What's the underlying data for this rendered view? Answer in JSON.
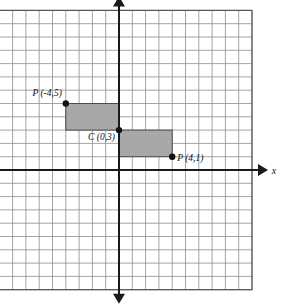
{
  "figure": {
    "background_color": "#ffffff",
    "grid_line_color": "#9a9a9a",
    "grid_border_color": "#555555",
    "axis_color": "#1a1a1a",
    "shape_fill_color": "#a8a8a8",
    "shape_stroke_color": "#4a4a4a",
    "point_color": "#111111"
  },
  "axes": {
    "x_label": "x",
    "y_label": "y",
    "origin_px": {
      "x": 119,
      "y": 170
    },
    "cell_size_px": 13.3,
    "x_range": [
      -9,
      10
    ],
    "y_range": [
      -9,
      12
    ],
    "grid_columns": 19,
    "grid_rows": 21,
    "show_tick_numbers": false
  },
  "chart_data": {
    "type": "scatter",
    "xlabel": "x",
    "ylabel": "y",
    "xlim": [
      -9,
      10
    ],
    "ylim": [
      -9,
      12
    ],
    "grid": true,
    "legend": "none",
    "points": [
      {
        "id": "p1",
        "label": "P (-4,5)",
        "x": -4,
        "y": 5,
        "label_dx": -4,
        "label_dy": -8,
        "label_anchor": "end"
      },
      {
        "id": "c",
        "label": "C (0,3)",
        "x": 0,
        "y": 3,
        "label_dx": -4,
        "label_dy": 10,
        "label_anchor": "end"
      },
      {
        "id": "p2",
        "label": "P (4,1)",
        "x": 4,
        "y": 1,
        "label_dx": 5,
        "label_dy": 4,
        "label_anchor": "start"
      }
    ],
    "rectangles": [
      {
        "id": "upper-rectangle",
        "x1": -4,
        "y1": 3,
        "x2": 0,
        "y2": 5,
        "fill": "#a8a8a8"
      },
      {
        "id": "lower-rectangle",
        "x1": 0,
        "y1": 1,
        "x2": 4,
        "y2": 3,
        "fill": "#a8a8a8"
      }
    ]
  }
}
